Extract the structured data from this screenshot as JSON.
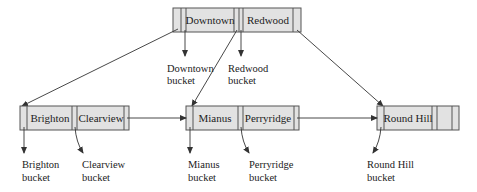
{
  "diagram": {
    "type": "B+-tree",
    "colors": {
      "node_fill": "#e2e2e2",
      "border": "#555555",
      "line": "#333333",
      "text": "#222222"
    },
    "root": {
      "keys": [
        "Downtown",
        "Redwood"
      ],
      "bucket_labels": [
        {
          "line1": "Downtown",
          "line2": "bucket"
        },
        {
          "line1": "Redwood",
          "line2": "bucket"
        }
      ]
    },
    "leaves": [
      {
        "keys": [
          "Brighton",
          "Clearview"
        ],
        "bucket_labels": [
          {
            "line1": "Brighton",
            "line2": "bucket"
          },
          {
            "line1": "Clearview",
            "line2": "bucket"
          }
        ]
      },
      {
        "keys": [
          "Mianus",
          "Perryridge"
        ],
        "bucket_labels": [
          {
            "line1": "Mianus",
            "line2": "bucket"
          },
          {
            "line1": "Perryridge",
            "line2": "bucket"
          }
        ]
      },
      {
        "keys": [
          "Round Hill",
          ""
        ],
        "bucket_labels": [
          {
            "line1": "Round Hill",
            "line2": "bucket"
          }
        ]
      }
    ]
  }
}
